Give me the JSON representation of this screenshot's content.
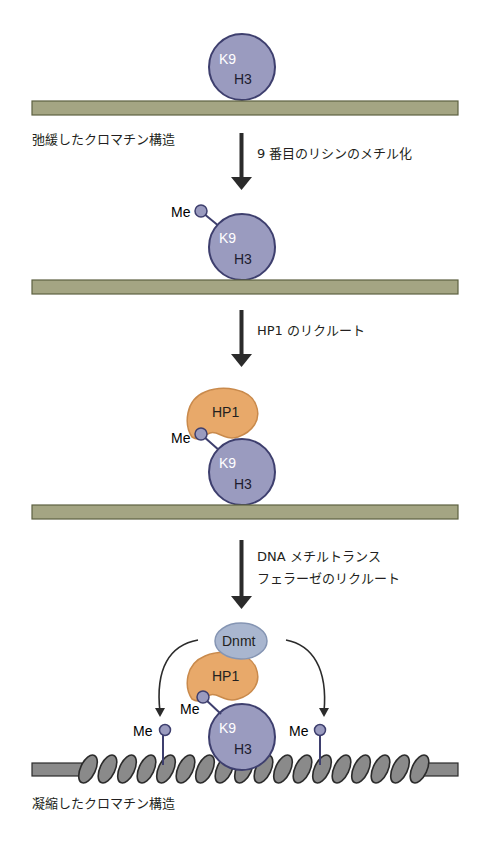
{
  "colors": {
    "histone_fill": "#9a9bbf",
    "histone_stroke": "#3e3f6e",
    "hp1_fill": "#e8a96a",
    "hp1_stroke": "#c98a4c",
    "dnmt_fill": "#a9b6cf",
    "dnmt_stroke": "#8595b3",
    "relaxed_fiber": "#a4a583",
    "relaxed_fiber_edge": "#5e6141",
    "condensed_fiber": "#8a8a8a",
    "condensed_fiber_edge": "#2b2b2b",
    "arrow": "#2b2b2b"
  },
  "labels": {
    "relaxed": "弛緩したクロマチン構造",
    "condensed": "凝縮したクロマチン構造"
  },
  "steps": [
    {
      "text_lines": [
        "9 番目のリシンのメチル化"
      ]
    },
    {
      "text_lines": [
        "HP1 のリクルート"
      ]
    },
    {
      "text_lines": [
        "DNA メチルトランス",
        "フェラーゼのリクルート"
      ]
    }
  ],
  "molecules": {
    "k9": "K9",
    "h3": "H3",
    "me": "Me",
    "hp1": "HP1",
    "dnmt": "Dnmt"
  }
}
